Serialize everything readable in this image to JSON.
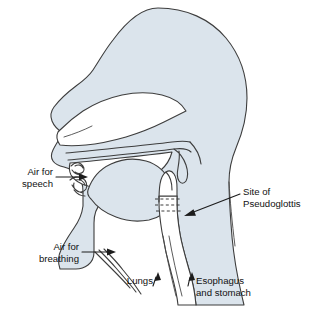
{
  "figure": {
    "kind": "anatomical-line-diagram",
    "background_color": "#ffffff",
    "tissue_fill_color": "#dbe4ec",
    "outline_color": "#3d3d3d",
    "label_text_color": "#111111",
    "leader_color": "#1c1c1c"
  },
  "labels": {
    "air_for_speech": {
      "line1": "Air for",
      "line2": "speech",
      "arrow": "arrow-right"
    },
    "air_for_breathing": {
      "line1": "Air for",
      "line2": "breathing",
      "arrow": "arrow-right"
    },
    "site_of_pseudoglottis": {
      "line1": "Site of",
      "line2": "Pseudoglottis",
      "arrow": "arrow-left-down"
    },
    "lungs": {
      "line1": "Lungs",
      "arrow": "arrow-up"
    },
    "esophagus_and_stomach": {
      "line1": "Esophagus",
      "line2": "and stomach",
      "arrow": "arrow-up"
    }
  },
  "structures": [
    {
      "name": "head-cranium",
      "label": "Head and cranium outline"
    },
    {
      "name": "nasal-cavity",
      "label": "Nasal cavity"
    },
    {
      "name": "hard-palate",
      "label": "Hard palate"
    },
    {
      "name": "soft-palate-uvula",
      "label": "Soft palate and uvula"
    },
    {
      "name": "tongue",
      "label": "Tongue"
    },
    {
      "name": "lips",
      "label": "Lips"
    },
    {
      "name": "oral-cavity",
      "label": "Oral cavity"
    },
    {
      "name": "pharynx",
      "label": "Pharynx"
    },
    {
      "name": "pseudoglottis-band",
      "label": "Pseudoglottis dashed band"
    },
    {
      "name": "trachea-stoma",
      "label": "Trachea toward lungs"
    },
    {
      "name": "esophagus",
      "label": "Esophagus"
    },
    {
      "name": "neck",
      "label": "Neck and shoulder outline"
    }
  ]
}
